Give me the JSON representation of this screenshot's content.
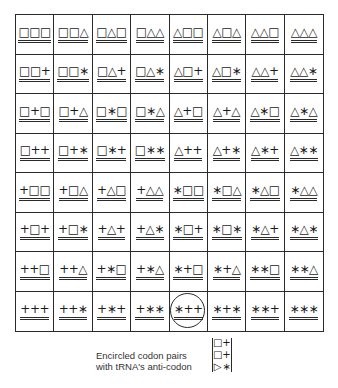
{
  "grid": {
    "rows": [
      [
        "□□□",
        "□□△",
        "□△□",
        "□△△",
        "△□□",
        "△□△",
        "△△□",
        "△△△"
      ],
      [
        "□□+",
        "□□∗",
        "□△+",
        "□△∗",
        "△□+",
        "△□∗",
        "△△+",
        "△△∗"
      ],
      [
        "□+□",
        "□+△",
        "□∗□",
        "□∗△",
        "△+□",
        "△+△",
        "△∗□",
        "△∗△"
      ],
      [
        "□++",
        "□+∗",
        "□∗+",
        "□∗∗",
        "△++",
        "△+∗",
        "△∗+",
        "△∗∗"
      ],
      [
        "+□□",
        "+□△",
        "+△□",
        "+△△",
        "∗□□",
        "∗□△",
        "∗△□",
        "∗△△"
      ],
      [
        "+□+",
        "+□∗",
        "+△+",
        "+△∗",
        "∗□+",
        "∗□∗",
        "∗△+",
        "∗△∗"
      ],
      [
        "++□",
        "++△",
        "+∗□",
        "+∗△",
        "∗+□",
        "∗+△",
        "∗∗□",
        "∗∗△"
      ],
      [
        "+++",
        "++∗",
        "+∗+",
        "+∗∗",
        "∗++",
        "∗+∗",
        "∗∗+",
        "∗∗∗"
      ]
    ],
    "circled_cell": {
      "row": 7,
      "col": 4,
      "codon": "∗++"
    }
  },
  "legend": {
    "caption_line1": "Encircled codon pairs",
    "caption_line2": "with tRNA's anti-codon",
    "anticodon_left": [
      "□",
      "□",
      "▷"
    ],
    "anticodon_right": [
      "+",
      "+",
      "∗"
    ]
  }
}
